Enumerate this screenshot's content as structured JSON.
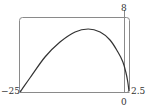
{
  "chart_data": {
    "type": "line",
    "title": "",
    "xlabel": "",
    "ylabel": "",
    "xlim": [
      -25,
      2.5
    ],
    "ylim": [
      0,
      8
    ],
    "grid": false,
    "legend": null,
    "tick_labels": {
      "x_min": "−25",
      "x_zero": "0",
      "x_max": "2.5",
      "y_max": "8"
    },
    "series": [
      {
        "name": "curve",
        "x": [
          -25,
          -22.5,
          -18.7,
          -14.9,
          -11.1,
          -7.8,
          -4.8,
          -2.3,
          -0.3,
          0.96,
          1.7,
          2.2,
          2.5
        ],
        "y": [
          0,
          1.49,
          3.73,
          5.33,
          6.4,
          6.72,
          6.4,
          5.55,
          4.27,
          3.2,
          2.13,
          1.07,
          0.1
        ]
      }
    ],
    "colors": {
      "frame": "#888888",
      "axis": "#888888",
      "curve": "#333333"
    }
  }
}
